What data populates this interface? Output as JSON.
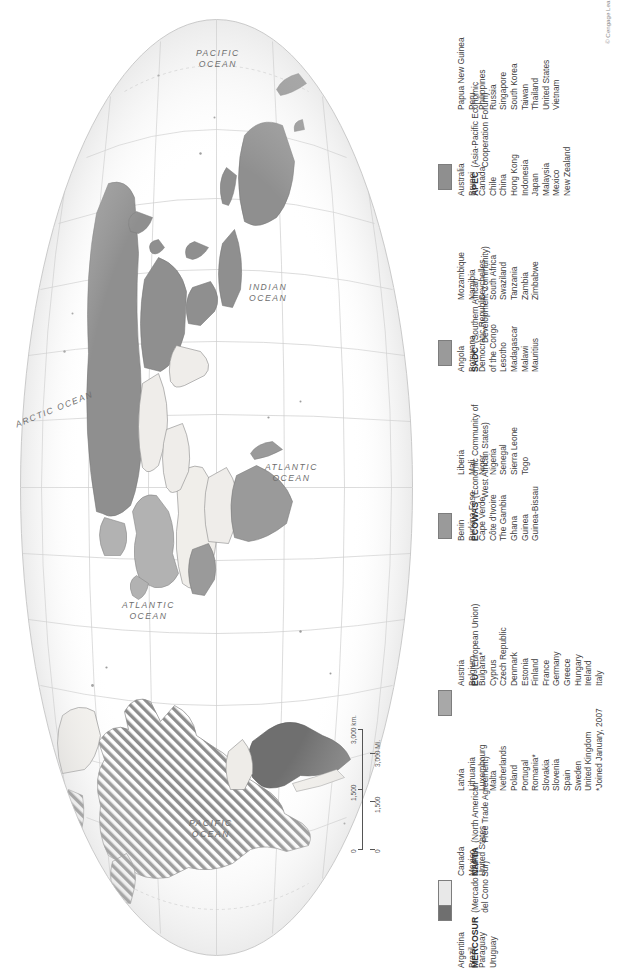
{
  "map": {
    "title": "World Regional Trade Blocs",
    "projection": "oval / elliptical world projection",
    "orientation_note": "map and all labels rotated 90 degrees counter-clockwise",
    "ocean_labels": [
      {
        "name": "PACIFIC OCEAN",
        "line1": "PACIFIC",
        "line2": "OCEAN"
      },
      {
        "name": "INDIAN OCEAN",
        "line1": "INDIAN",
        "line2": "OCEAN"
      },
      {
        "name": "ARCTIC OCEAN",
        "line1": "ARCTIC OCEAN",
        "line2": ""
      },
      {
        "name": "ATLANTIC OCEAN",
        "line1": "ATLANTIC",
        "line2": "OCEAN"
      },
      {
        "name": "ATLANTIC OCEAN",
        "line1": "ATLANTIC",
        "line2": "OCEAN"
      },
      {
        "name": "PACIFIC OCEAN",
        "line1": "PACIFIC",
        "line2": "OCEAN"
      }
    ],
    "scale_bar": {
      "km_labels": [
        "0",
        "1,500",
        "3,000 km."
      ],
      "mi_labels": [
        "0",
        "1,500",
        "3,000 Mi."
      ]
    }
  },
  "colors": {
    "nafta": "#e8e8e8",
    "mercosur": "#6f6f6f",
    "eu": "#a8a8a8",
    "ecowas": "#9a9a9a",
    "sadc": "#9a9a9a",
    "apec": "#8f8f8f",
    "ocean": "#ffffff",
    "land": "#f2f0ec",
    "graticule": "#c9c9c9",
    "coast": "#8c8c8c",
    "text": "#3d3d3d"
  },
  "legend": {
    "groups": [
      {
        "abbr": "NAFTA",
        "full_line1": "(North American",
        "full_line2": "Free Trade Agreement)",
        "swatch": "#e8e8e8",
        "columns": [
          [
            "Canada",
            "Mexico",
            "United States"
          ]
        ],
        "footnote": ""
      },
      {
        "abbr": "MERCOSUR",
        "full_line1": "(Mercado Comun",
        "full_line2": "del Cono Sur)",
        "swatch": "#6f6f6f",
        "columns": [
          [
            "Argentina",
            "Brazil",
            "Paraguay",
            "Uruguay"
          ]
        ],
        "footnote": ""
      },
      {
        "abbr": "EU",
        "full_line1": "(European Union)",
        "full_line2": "",
        "swatch": "#a8a8a8",
        "columns": [
          [
            "Austria",
            "Belgium",
            "Bulgaria*",
            "Cyprus",
            "Czech Republic",
            "Denmark",
            "Estonia",
            "Finland",
            "France",
            "Germany",
            "Greece",
            "Hungary",
            "Ireland",
            "Italy"
          ],
          [
            "Latvia",
            "Lithuania",
            "Luxembourg",
            "Malta",
            "Netherlands",
            "Poland",
            "Portugal",
            "Romania*",
            "Slovakia",
            "Slovenia",
            "Spain",
            "Sweden",
            "United Kingdom"
          ]
        ],
        "footnote": "*Joined January, 2007"
      },
      {
        "abbr": "ECOWAS",
        "full_line1": "(Economic Community of",
        "full_line2": "West African States)",
        "swatch": "#9a9a9a",
        "columns": [
          [
            "Benin",
            "Burkina Faso",
            "Cape Verde",
            "Côte d'Ivoire",
            "The Gambia",
            "Ghana",
            "Guinea",
            "Guinea-Bissau"
          ],
          [
            "Liberia",
            "Mali",
            "Niger",
            "Nigeria",
            "Senegal",
            "Sierra Leone",
            "Togo"
          ]
        ],
        "footnote": ""
      },
      {
        "abbr": "SADC",
        "full_line1": "(Southern African",
        "full_line2": "Development Community)",
        "swatch": "#9a9a9a",
        "columns": [
          [
            "Angola",
            "Botswana",
            "Democratic Republic",
            "   of the Congo",
            "Lesotho",
            "Madagascar",
            "Malawi",
            "Mauritius"
          ],
          [
            "Mozambique",
            "Namibia",
            "Seychelles",
            "South Africa",
            "Swaziland",
            "Tanzania",
            "Zambia",
            "Zimbabwe"
          ]
        ],
        "footnote": ""
      },
      {
        "abbr": "APEC",
        "full_line1": "(Asia-Pacific Economic",
        "full_line2": "Cooperation Forum)",
        "swatch": "#8f8f8f",
        "columns": [
          [
            "Australia",
            "Brunei",
            "Canada",
            "Chile",
            "China",
            "Hong Kong",
            "Indonesia",
            "Japan",
            "Malaysia",
            "Mexico",
            "New Zealand"
          ],
          [
            "Papua New Guinea",
            "Peru",
            "Philippines",
            "Russia",
            "Singapore",
            "South Korea",
            "Taiwan",
            "Thailand",
            "United States",
            "Vietnam"
          ]
        ],
        "footnote": ""
      }
    ],
    "copyright": "© Cengage Learning"
  }
}
